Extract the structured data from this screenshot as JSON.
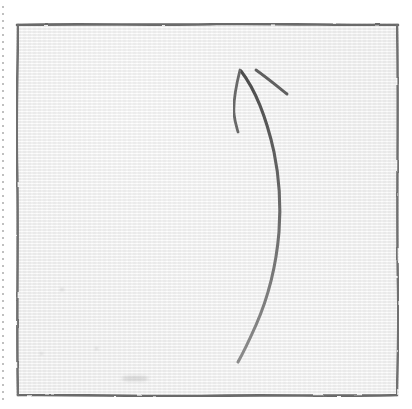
{
  "page": {
    "background_color": "#ffffff",
    "width": 412,
    "height": 409
  },
  "practice_grid": {
    "name": "calligraphy practice square",
    "paper_color": "#f1f1f1",
    "border_color": "#6f6f6f",
    "guide_color": "#4a4a4a",
    "box": {
      "x": 16,
      "y": 23,
      "width": 383,
      "height": 374
    },
    "guides": [
      {
        "id": "vertical-center-guide",
        "orientation": "vertical",
        "style": "solid-with-center-gap",
        "position_x": 195
      },
      {
        "id": "horizontal-center-guide",
        "orientation": "horizontal",
        "style": "dashed",
        "position_y": 193,
        "dash_length": 33,
        "dash_gap": 17,
        "dash_count": 8
      }
    ],
    "margin_artifact": {
      "id": "left-margin-dotted-artifact",
      "description": "faint dotted scan edge"
    }
  },
  "handwriting": {
    "ink_color": "#5e5e5e",
    "medium": "pencil",
    "stroke_count": 3,
    "strokes": [
      {
        "id": "stroke-long-curve",
        "label": "long curved vertical stroke bowing right",
        "start": [
          241,
          71
        ],
        "end": [
          238,
          362
        ],
        "extreme_right_x": 281,
        "extreme_right_y": 215
      },
      {
        "id": "stroke-short-left",
        "label": "short stroke descending left from apex",
        "start": [
          240,
          70
        ],
        "end": [
          238,
          132
        ]
      },
      {
        "id": "stroke-upper-diagonal",
        "label": "short diagonal stroke upper right",
        "start": [
          256,
          70
        ],
        "end": [
          287,
          94
        ]
      }
    ]
  },
  "paper_marks": [
    {
      "id": "smudge-lower-left",
      "x": 40,
      "y": 352,
      "size": 3
    },
    {
      "id": "smudge-lower-center",
      "x": 95,
      "y": 347,
      "size": 3
    },
    {
      "id": "smudge-bottom-center",
      "x": 130,
      "y": 378,
      "size": 9
    },
    {
      "id": "smudge-mid-left",
      "x": 60,
      "y": 288,
      "size": 4
    }
  ]
}
